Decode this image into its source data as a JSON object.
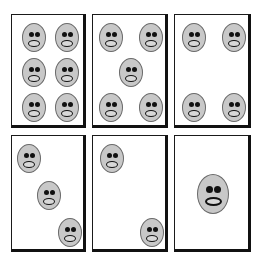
{
  "colors": {
    "card_border": "#111111",
    "card_fill": "#ffffff",
    "face_fill": "#c8c8c8",
    "face_features": "#111111"
  },
  "cards": [
    {
      "id": "card-6",
      "count": 6,
      "x": 11,
      "y": 14,
      "w": 75,
      "h": 114,
      "faces": [
        [
          22,
          22
        ],
        [
          55,
          22
        ],
        [
          22,
          57
        ],
        [
          55,
          57
        ],
        [
          22,
          92
        ],
        [
          55,
          92
        ]
      ]
    },
    {
      "id": "card-5",
      "count": 5,
      "x": 92,
      "y": 14,
      "w": 76,
      "h": 114,
      "faces": [
        [
          18,
          22
        ],
        [
          58,
          22
        ],
        [
          38,
          57
        ],
        [
          18,
          92
        ],
        [
          58,
          92
        ]
      ]
    },
    {
      "id": "card-4",
      "count": 4,
      "x": 174,
      "y": 14,
      "w": 77,
      "h": 114,
      "faces": [
        [
          19,
          22
        ],
        [
          59,
          22
        ],
        [
          19,
          92
        ],
        [
          59,
          92
        ]
      ]
    },
    {
      "id": "card-3",
      "count": 3,
      "x": 11,
      "y": 135,
      "w": 75,
      "h": 117,
      "faces": [
        [
          17,
          22
        ],
        [
          37,
          59
        ],
        [
          58,
          96
        ]
      ]
    },
    {
      "id": "card-2",
      "count": 2,
      "x": 92,
      "y": 135,
      "w": 76,
      "h": 117,
      "faces": [
        [
          19,
          22
        ],
        [
          59,
          96
        ]
      ]
    },
    {
      "id": "card-1",
      "count": 1,
      "x": 174,
      "y": 135,
      "w": 77,
      "h": 117,
      "faces": [
        [
          38,
          58
        ]
      ],
      "big": true
    }
  ]
}
